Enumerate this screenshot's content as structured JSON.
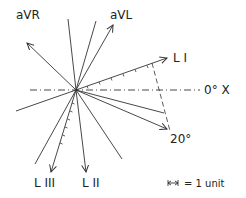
{
  "diagram": {
    "labels": {
      "avr": "aVR",
      "avl": "aVL",
      "lead1": "L I",
      "lead2": "L II",
      "lead3": "L III",
      "x_axis": "0° X",
      "angle": "20°",
      "unit_legend": "= 1 unit"
    },
    "colors": {
      "line": "#333333",
      "text": "#222222",
      "background": "#ffffff"
    },
    "center": [
      76,
      90
    ],
    "leads": [
      {
        "name": "aVR",
        "end": [
          28,
          44
        ],
        "arrow": true
      },
      {
        "name": "aVL",
        "end": [
          112,
          26
        ],
        "arrow": true
      },
      {
        "name": "L I",
        "end": [
          166,
          58
        ],
        "arrow": true,
        "ticks": 7
      },
      {
        "name": "L II",
        "end": [
          86,
          170
        ],
        "arrow": true
      },
      {
        "name": "L III",
        "end": [
          51,
          170
        ],
        "arrow": true,
        "ticks": 7
      },
      {
        "name": "20° resultant",
        "end": [
          167,
          129
        ],
        "arrow": true
      }
    ],
    "plain_lines": [
      {
        "end": [
          68,
          19
        ]
      },
      {
        "end": [
          96,
          21
        ]
      },
      {
        "end": [
          16,
          111
        ]
      },
      {
        "end": [
          35,
          164
        ]
      },
      {
        "end": [
          122,
          159
        ]
      },
      {
        "end": [
          164,
          113
        ]
      }
    ]
  }
}
